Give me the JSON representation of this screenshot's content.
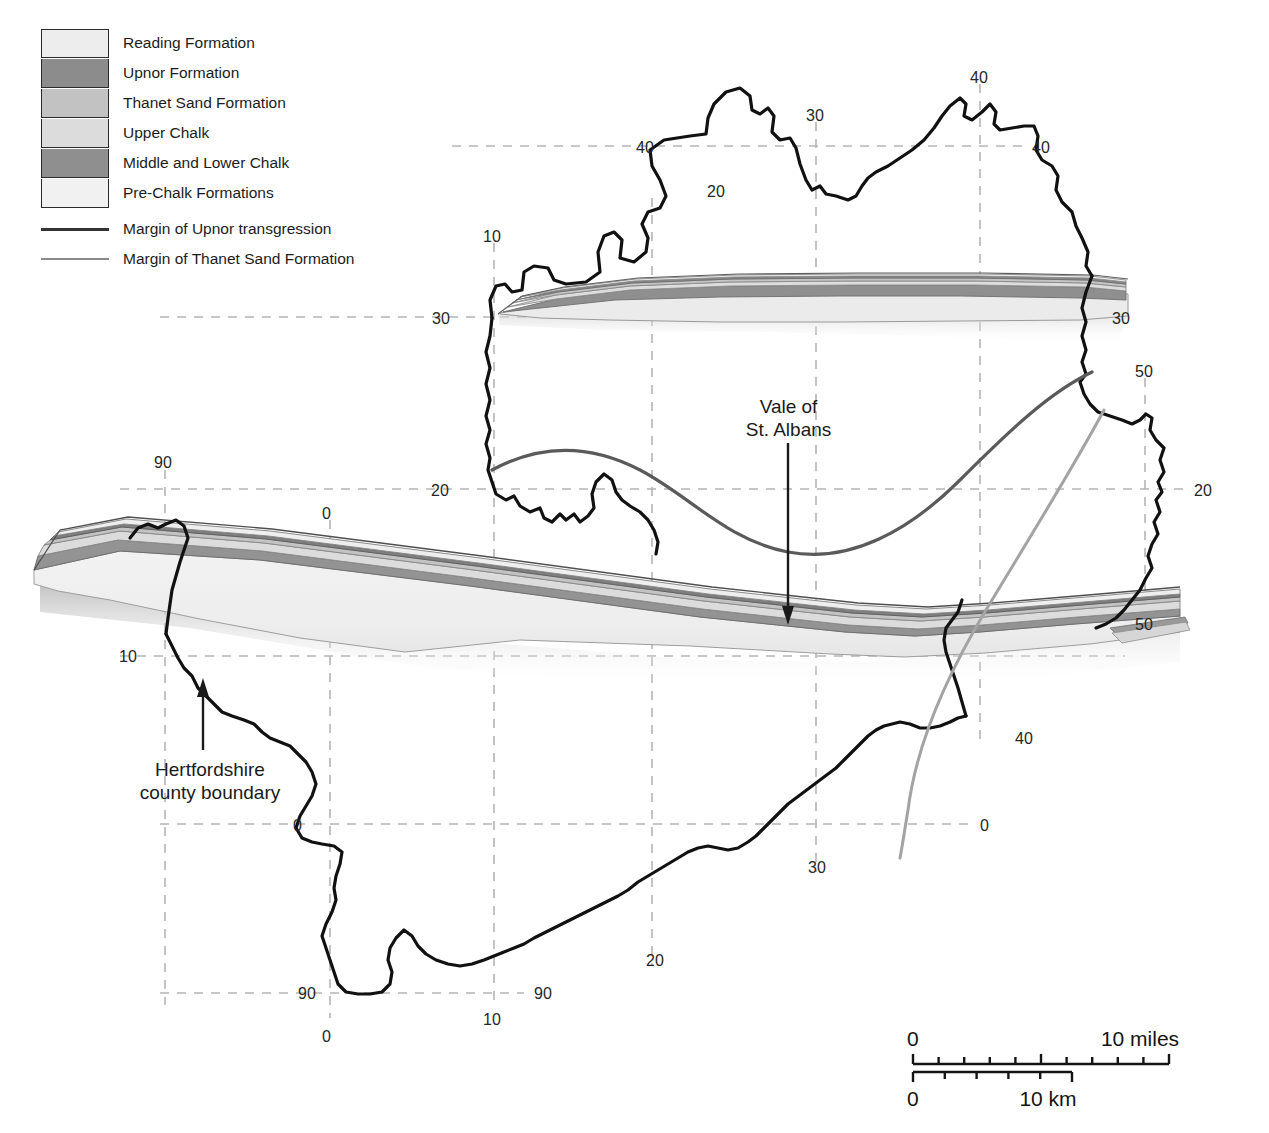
{
  "legend": {
    "swatches": [
      {
        "label": "Reading Formation",
        "color": "#ededed"
      },
      {
        "label": "Upnor Formation",
        "color": "#8c8c8c"
      },
      {
        "label": "Thanet Sand Formation",
        "color": "#c2c2c2"
      },
      {
        "label": "Upper Chalk",
        "color": "#dcdcdc"
      },
      {
        "label": "Middle and Lower Chalk",
        "color": "#8f8f8f"
      },
      {
        "label": "Pre-Chalk Formations",
        "color": "#f1f1f1"
      }
    ],
    "lines": [
      {
        "label": "Margin of Upnor transgression",
        "color": "#333333"
      },
      {
        "label": "Margin of Thanet Sand Formation",
        "color": "#8a8a8a"
      }
    ]
  },
  "annotations": [
    {
      "name": "vale-of-st-albans",
      "line1": "Vale of",
      "line2": "St. Albans"
    },
    {
      "name": "hertfordshire-county-boundary",
      "line1": "Hertfordshire",
      "line2": "county boundary"
    }
  ],
  "grid_labels": [
    {
      "text": "40",
      "x": 970,
      "y": 70
    },
    {
      "text": "30",
      "x": 806,
      "y": 108
    },
    {
      "text": "40",
      "x": 636,
      "y": 140
    },
    {
      "text": "40",
      "x": 1032,
      "y": 140
    },
    {
      "text": "20",
      "x": 707,
      "y": 184
    },
    {
      "text": "10",
      "x": 483,
      "y": 229
    },
    {
      "text": "30",
      "x": 432,
      "y": 311
    },
    {
      "text": "30",
      "x": 1112,
      "y": 311
    },
    {
      "text": "50",
      "x": 1135,
      "y": 364
    },
    {
      "text": "90",
      "x": 154,
      "y": 455
    },
    {
      "text": "20",
      "x": 431,
      "y": 483
    },
    {
      "text": "20",
      "x": 1194,
      "y": 483
    },
    {
      "text": "0",
      "x": 322,
      "y": 506
    },
    {
      "text": "50",
      "x": 1135,
      "y": 617
    },
    {
      "text": "10",
      "x": 119,
      "y": 649
    },
    {
      "text": "40",
      "x": 1015,
      "y": 731
    },
    {
      "text": "0",
      "x": 293,
      "y": 818
    },
    {
      "text": "0",
      "x": 980,
      "y": 818
    },
    {
      "text": "30",
      "x": 808,
      "y": 860
    },
    {
      "text": "20",
      "x": 646,
      "y": 953
    },
    {
      "text": "90",
      "x": 298,
      "y": 986
    },
    {
      "text": "90",
      "x": 534,
      "y": 986
    },
    {
      "text": "0",
      "x": 322,
      "y": 1029
    },
    {
      "text": "10",
      "x": 483,
      "y": 1012
    }
  ],
  "scale_bar": {
    "miles": {
      "start_label": "0",
      "end_label": "10 miles",
      "ticks": 10
    },
    "km": {
      "start_label": "0",
      "end_label": "10 km",
      "ticks": 5
    }
  },
  "colors": {
    "county_outline": "#111111",
    "grid_dash": "#b5b5b5",
    "upnor_margin_line": "#5a5a5a",
    "thanet_margin_line": "#a0a0a0",
    "reading": "#ededed",
    "upnor": "#8c8c8c",
    "thanet_sand": "#c2c2c2",
    "upper_chalk": "#dcdcdc",
    "middle_lower_chalk": "#8f8f8f",
    "pre_chalk": "#f1f1f1",
    "shadow": "#cfcfcf"
  }
}
